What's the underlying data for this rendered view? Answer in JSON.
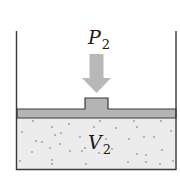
{
  "diagram": {
    "type": "piston-cylinder",
    "pressure_label": {
      "symbol": "P",
      "subscript": "2"
    },
    "volume_label": {
      "symbol": "V",
      "subscript": "2"
    },
    "colors": {
      "wall": "#3a3a3a",
      "piston_fill": "#b4b4b4",
      "piston_stroke": "#3a3a3a",
      "arrow_fill": "#b8b8b8",
      "gas_fill": "#ececec",
      "particle": "#a8a8a8"
    },
    "particles": [
      [
        33,
        121
      ],
      [
        52,
        127
      ],
      [
        69,
        124
      ],
      [
        100,
        121
      ],
      [
        134,
        121
      ],
      [
        161,
        121
      ],
      [
        22,
        132
      ],
      [
        55,
        135
      ],
      [
        61,
        133
      ],
      [
        94,
        127
      ],
      [
        116,
        128
      ],
      [
        137,
        127
      ],
      [
        171,
        131
      ],
      [
        36,
        141
      ],
      [
        42,
        142
      ],
      [
        80,
        137
      ],
      [
        100,
        138
      ],
      [
        106,
        139
      ],
      [
        129,
        139
      ],
      [
        144,
        137
      ],
      [
        154,
        137
      ],
      [
        32,
        152
      ],
      [
        50,
        148
      ],
      [
        60,
        144
      ],
      [
        70,
        151
      ],
      [
        82,
        151
      ],
      [
        85,
        148
      ],
      [
        99,
        153
      ],
      [
        112,
        149
      ],
      [
        137,
        154
      ],
      [
        146,
        155
      ],
      [
        162,
        150
      ],
      [
        20,
        161
      ],
      [
        52,
        160
      ],
      [
        52,
        164
      ],
      [
        86,
        164
      ],
      [
        128,
        162
      ],
      [
        146,
        162
      ],
      [
        160,
        164
      ],
      [
        173,
        161
      ]
    ]
  }
}
